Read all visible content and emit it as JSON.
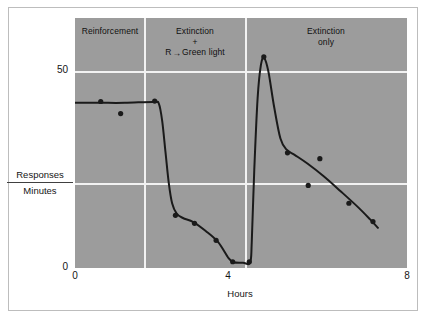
{
  "chart_data": {
    "type": "line",
    "title": "",
    "xlabel": "Hours",
    "ylabel_numerator": "Responses",
    "ylabel_denominator": "Minutes",
    "xlim": [
      0,
      8
    ],
    "ylim": [
      0,
      56
    ],
    "xticks": [
      "0",
      "4",
      "8"
    ],
    "xtick_values": [
      0,
      4,
      8
    ],
    "yticks": [
      "0",
      "50"
    ],
    "ytick_values": [
      0,
      50
    ],
    "grid": "white gridlines at y=25 and y=50; white vertical panel dividers",
    "legend": "none",
    "panels": [
      {
        "id": "reinforcement",
        "label": "Reinforcement",
        "x_start": 0,
        "x_end": 2.0
      },
      {
        "id": "extinction-plus-green-light",
        "label_line1": "Extinction",
        "label_line2": "+",
        "label_line3_prefix": "R",
        "label_line3_arrow": "→",
        "label_line3_suffix": "Green light",
        "x_start": 2.0,
        "x_end": 4.25
      },
      {
        "id": "extinction-only",
        "label_line1": "Extinction",
        "label_line2": "only",
        "x_start": 4.25,
        "x_end": 8.0
      }
    ],
    "series": [
      {
        "name": "Response rate curve",
        "kind": "line",
        "points": [
          [
            0.0,
            37.0
          ],
          [
            0.6,
            37.0
          ],
          [
            1.2,
            37.0
          ],
          [
            1.9,
            37.2
          ],
          [
            2.02,
            36.8
          ],
          [
            2.1,
            33.0
          ],
          [
            2.18,
            26.0
          ],
          [
            2.26,
            19.0
          ],
          [
            2.34,
            14.5
          ],
          [
            2.45,
            12.2
          ],
          [
            2.6,
            11.2
          ],
          [
            2.85,
            10.3
          ],
          [
            3.15,
            8.3
          ],
          [
            3.45,
            5.8
          ],
          [
            3.7,
            2.2
          ],
          [
            3.82,
            1.3
          ],
          [
            4.05,
            1.2
          ],
          [
            4.22,
            1.2
          ],
          [
            4.26,
            6.0
          ],
          [
            4.32,
            22.0
          ],
          [
            4.4,
            38.0
          ],
          [
            4.48,
            45.5
          ],
          [
            4.56,
            47.0
          ],
          [
            4.66,
            44.0
          ],
          [
            4.8,
            36.0
          ],
          [
            4.95,
            29.0
          ],
          [
            5.1,
            26.5
          ],
          [
            5.3,
            25.3
          ],
          [
            5.6,
            23.4
          ],
          [
            6.0,
            20.5
          ],
          [
            6.4,
            17.2
          ],
          [
            6.8,
            13.8
          ],
          [
            7.1,
            11.0
          ],
          [
            7.3,
            9.0
          ]
        ]
      },
      {
        "name": "Observed data points",
        "kind": "scatter",
        "points": [
          [
            0.62,
            37.3
          ],
          [
            1.1,
            34.6
          ],
          [
            1.92,
            37.4
          ],
          [
            2.42,
            11.8
          ],
          [
            2.88,
            10.0
          ],
          [
            3.4,
            6.2
          ],
          [
            3.8,
            1.4
          ],
          [
            4.2,
            1.4
          ],
          [
            4.55,
            47.3
          ],
          [
            5.12,
            25.8
          ],
          [
            5.9,
            24.5
          ],
          [
            5.62,
            18.5
          ],
          [
            6.6,
            14.5
          ],
          [
            7.18,
            10.4
          ]
        ]
      }
    ],
    "colors": {
      "plot_background": "#9c9c9c",
      "gridline": "#f2f2f2",
      "curve": "#1a1a1a",
      "marker": "#1a1a1a",
      "page_background": "#ffffff",
      "frame_border": "#bdbdbd",
      "text": "#151515"
    }
  }
}
